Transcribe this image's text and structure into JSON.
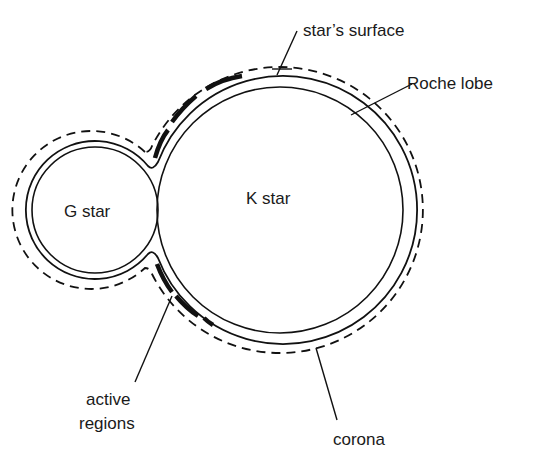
{
  "diagram": {
    "type": "binary-star-cross-section",
    "stars": [
      {
        "name": "G star",
        "label": "G star"
      },
      {
        "name": "K star",
        "label": "K star"
      }
    ],
    "labels": {
      "stars_surface": "star’s surface",
      "roche_lobe": "Roche lobe",
      "active_regions_line1": "active",
      "active_regions_line2": "regions",
      "corona": "corona",
      "g_star": "G star",
      "k_star": "K star"
    },
    "colors": {
      "line": "#111111",
      "background": "#ffffff",
      "text": "#1a1a1a"
    }
  }
}
